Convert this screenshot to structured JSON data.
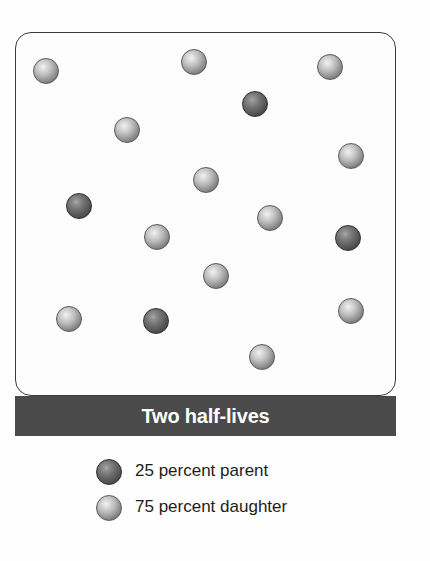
{
  "figure": {
    "title": "Two half-lives",
    "type": "radioactive-decay-diagram",
    "colors": {
      "caption_bar": "#4a4a4a",
      "caption_text": "#ffffff",
      "parent_sphere": "#4a4a4a",
      "daughter_sphere": "#b4b4b4",
      "box_border": "#3a3a3a",
      "background": "#ffffff"
    }
  },
  "chamber": {
    "name": "particle-chamber",
    "total_particles": 16,
    "parent_count": 4,
    "daughter_count": 12,
    "particles": [
      {
        "kind": "daughter",
        "cx": 46,
        "cy": 71,
        "r": 13
      },
      {
        "kind": "daughter",
        "cx": 194,
        "cy": 62,
        "r": 13
      },
      {
        "kind": "daughter",
        "cx": 330,
        "cy": 67,
        "r": 13
      },
      {
        "kind": "parent",
        "cx": 255,
        "cy": 104,
        "r": 13
      },
      {
        "kind": "daughter",
        "cx": 127,
        "cy": 130,
        "r": 13
      },
      {
        "kind": "daughter",
        "cx": 351,
        "cy": 156,
        "r": 13
      },
      {
        "kind": "daughter",
        "cx": 206,
        "cy": 180,
        "r": 13
      },
      {
        "kind": "parent",
        "cx": 79,
        "cy": 206,
        "r": 13
      },
      {
        "kind": "daughter",
        "cx": 270,
        "cy": 218,
        "r": 13
      },
      {
        "kind": "daughter",
        "cx": 157,
        "cy": 237,
        "r": 13
      },
      {
        "kind": "parent",
        "cx": 348,
        "cy": 238,
        "r": 13
      },
      {
        "kind": "daughter",
        "cx": 216,
        "cy": 276,
        "r": 13
      },
      {
        "kind": "daughter",
        "cx": 351,
        "cy": 311,
        "r": 13
      },
      {
        "kind": "daughter",
        "cx": 69,
        "cy": 319,
        "r": 13
      },
      {
        "kind": "parent",
        "cx": 156,
        "cy": 321,
        "r": 13
      },
      {
        "kind": "daughter",
        "cx": 262,
        "cy": 357,
        "r": 13
      }
    ]
  },
  "legend": {
    "items": [
      {
        "swatch": "parent",
        "label": "25 percent parent"
      },
      {
        "swatch": "daughter",
        "label": "75 percent daughter"
      }
    ]
  }
}
